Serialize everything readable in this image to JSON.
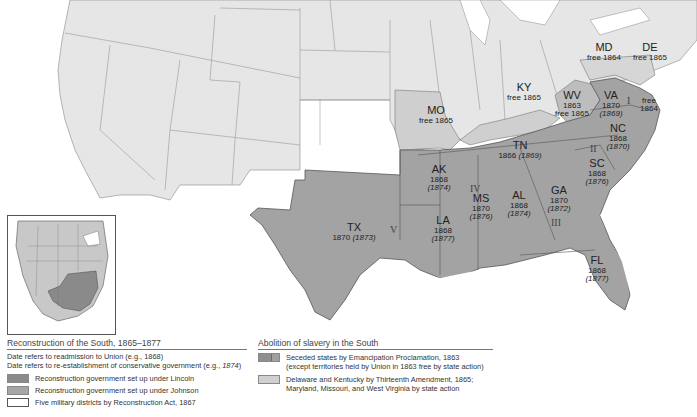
{
  "map": {
    "states": [
      {
        "abbr": "MD",
        "date": "free 1864",
        "conservative": ""
      },
      {
        "abbr": "DE",
        "date": "free 1865",
        "conservative": ""
      },
      {
        "abbr": "WV",
        "date": "1863",
        "extra": "free 1865",
        "conservative": ""
      },
      {
        "abbr": "VA",
        "date": "1870",
        "conservative": "(1869)"
      },
      {
        "abbr": "KY",
        "date": "free 1865",
        "conservative": ""
      },
      {
        "abbr": "MO",
        "date": "free 1865",
        "conservative": ""
      },
      {
        "abbr": "NC",
        "date": "1868",
        "conservative": "(1870)"
      },
      {
        "abbr": "TN",
        "date": "1866",
        "conservative": "(1869)"
      },
      {
        "abbr": "SC",
        "date": "1868",
        "conservative": "(1876)"
      },
      {
        "abbr": "AK",
        "date": "1868",
        "conservative": "(1874)"
      },
      {
        "abbr": "GA",
        "date": "1870",
        "conservative": "(1872)"
      },
      {
        "abbr": "AL",
        "date": "1868",
        "conservative": "(1874)"
      },
      {
        "abbr": "MS",
        "date": "1870",
        "conservative": "(1876)"
      },
      {
        "abbr": "LA",
        "date": "1868",
        "conservative": "(1877)"
      },
      {
        "abbr": "TX",
        "date": "1870",
        "conservative": "(1873)"
      },
      {
        "abbr": "FL",
        "date": "1868",
        "conservative": "(1877)"
      }
    ],
    "va_shore_note": "free",
    "va_shore_year": "1864",
    "military_districts": [
      "I",
      "II",
      "III",
      "IV",
      "V"
    ]
  },
  "legend_left": {
    "title": "Reconstruction of the South, 1865–1877",
    "note1": "Date refers to readmission to Union (e.g., 1868)",
    "note2_prefix": "Date refers to re-establishment of conservative government (e.g., ",
    "note2_italic": "1874",
    "note2_suffix": ")",
    "items": [
      {
        "label": "Reconstruction government set up under Lincoln",
        "color": "#8a8a8a"
      },
      {
        "label": "Reconstruction government set up under Johnson",
        "color": "#a6a6a6"
      },
      {
        "label": "Five military districts by Reconstruction Act, 1867",
        "color": "#ffffff"
      }
    ]
  },
  "legend_right": {
    "title": "Abolition of slavery in the South",
    "items": [
      {
        "line1": "Seceded states by Emancipation Proclamation, 1863",
        "line2": "(except territories held by Union in 1863 free by state action)",
        "color": "#8f8f8f"
      },
      {
        "line1": "Delaware and Kentucky by Thirteenth Amendment, 1865;",
        "line2": "Maryland, Missouri, and West Virginia by state action",
        "color": "#d0d0d0"
      }
    ]
  },
  "colors": {
    "north": "#e6e6e6",
    "border_state": "#cfcfcf",
    "confederate": "#9d9d9d",
    "upper_south": "#a9a9a9",
    "water": "#ffffff"
  }
}
